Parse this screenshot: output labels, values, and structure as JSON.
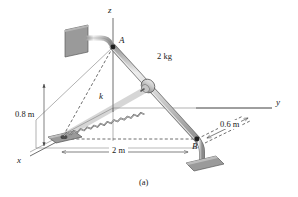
{
  "figure": {
    "caption": "(a)",
    "background_color": "#ffffff",
    "line_color": "#4a4a4a",
    "rod_fill": "#d8d8d8",
    "plate_fill": "#9a9a9a",
    "spring_color": "#8c8c8c",
    "accent_dark": "#2b2b2b"
  },
  "axes": {
    "x_label": "x",
    "y_label": "y",
    "z_label": "z"
  },
  "points": {
    "a_label": "A",
    "b_label": "B"
  },
  "annotations": {
    "mass_label": "2 kg",
    "spring_constant_label": "k",
    "height_label": "0.8 m",
    "span_label": "2 m",
    "offset_label": "0.6 m"
  }
}
